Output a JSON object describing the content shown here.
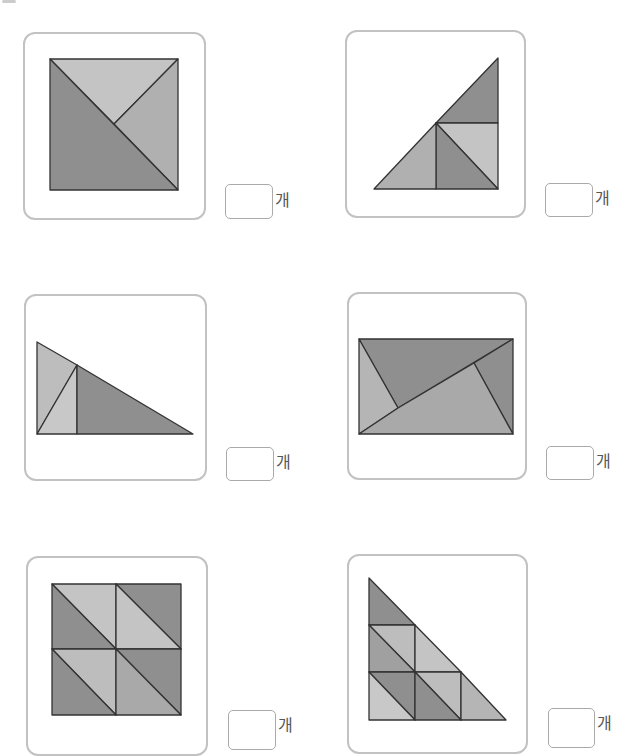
{
  "unit_label": "개",
  "colors": {
    "dark": "#8f8f8f",
    "medium": "#a9a9a9",
    "light": "#c4c4c4",
    "stroke": "#333333",
    "panel_border": "#c2c2c2"
  },
  "problems": [
    {
      "id": 1,
      "shape": "square split into 3 triangles",
      "answer": ""
    },
    {
      "id": 2,
      "shape": "right triangle split into 4 triangles",
      "answer": ""
    },
    {
      "id": 3,
      "shape": "right triangle split into 3 triangles",
      "answer": ""
    },
    {
      "id": 4,
      "shape": "rectangle split into 4 triangles",
      "answer": ""
    },
    {
      "id": 5,
      "shape": "square split into 8 triangles",
      "answer": ""
    },
    {
      "id": 6,
      "shape": "right triangle split into 9 triangles",
      "answer": ""
    }
  ]
}
